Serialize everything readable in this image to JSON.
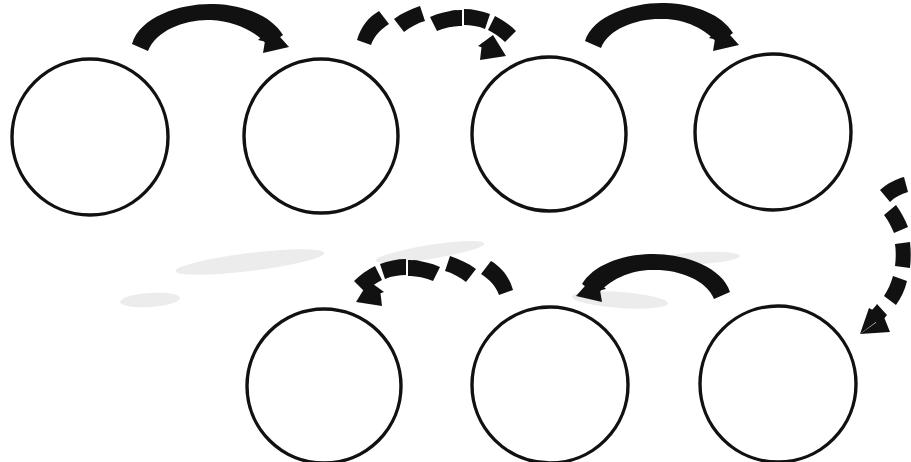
{
  "diagram": {
    "title": "Cycle process diagram",
    "type": "cycle-flow",
    "background_color": "#ffffff",
    "stroke_color": "#111111",
    "arrow_color": "#111111",
    "canvas": {
      "width": 911,
      "height": 462
    },
    "node_shape": "circle",
    "node_fill": "#ffffff",
    "node_count": 7,
    "nodes": [
      {
        "id": "node-1",
        "label": "",
        "row": "top",
        "index": 1,
        "cx": 90,
        "cy": 137,
        "r": 78
      },
      {
        "id": "node-2",
        "label": "",
        "row": "top",
        "index": 2,
        "cx": 321,
        "cy": 136,
        "r": 77
      },
      {
        "id": "node-3",
        "label": "",
        "row": "top",
        "index": 3,
        "cx": 549,
        "cy": 134,
        "r": 77
      },
      {
        "id": "node-4",
        "label": "",
        "row": "top",
        "index": 4,
        "cx": 773,
        "cy": 132,
        "r": 78
      },
      {
        "id": "node-5",
        "label": "",
        "row": "bottom",
        "index": 5,
        "cx": 778,
        "cy": 384,
        "r": 78
      },
      {
        "id": "node-6",
        "label": "",
        "row": "bottom",
        "index": 6,
        "cx": 550,
        "cy": 385,
        "r": 78
      },
      {
        "id": "node-7",
        "label": "",
        "row": "bottom",
        "index": 7,
        "cx": 324,
        "cy": 386,
        "r": 77
      }
    ],
    "arrow_count": 6,
    "arrows": [
      {
        "id": "arrow-1",
        "style": "solid",
        "from": "node-1",
        "to": "node-2",
        "direction": "right",
        "label": ""
      },
      {
        "id": "arrow-2",
        "style": "dashed",
        "from": "node-2",
        "to": "node-3",
        "direction": "right",
        "label": ""
      },
      {
        "id": "arrow-3",
        "style": "solid",
        "from": "node-3",
        "to": "node-4",
        "direction": "right",
        "label": ""
      },
      {
        "id": "arrow-4",
        "style": "dashed",
        "from": "node-4",
        "to": "node-5",
        "direction": "down",
        "label": ""
      },
      {
        "id": "arrow-5",
        "style": "solid",
        "from": "node-5",
        "to": "node-6",
        "direction": "left",
        "label": ""
      },
      {
        "id": "arrow-6",
        "style": "dashed",
        "from": "node-6",
        "to": "node-7",
        "direction": "left",
        "label": ""
      }
    ],
    "legend": []
  }
}
